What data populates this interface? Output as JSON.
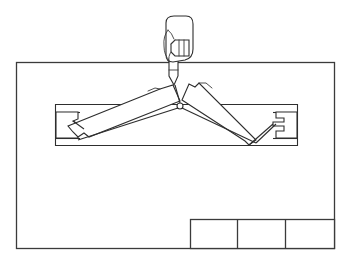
{
  "figure": {
    "title": "",
    "caption": "",
    "background_color": "#ffffff",
    "line_color": "#2e2e2e",
    "frame_color": "#3b3b3b",
    "width": 353,
    "height": 264
  },
  "drawing_frame": {
    "label": "",
    "x": 16,
    "y": 62,
    "width": 319,
    "height": 187
  },
  "title_block": {
    "label": "",
    "x": 190,
    "y": 219,
    "width": 145,
    "height": 30,
    "cells": [
      {
        "label": "",
        "value": ""
      },
      {
        "label": "",
        "value": ""
      },
      {
        "label": "",
        "value": ""
      }
    ],
    "divider_x": [
      237,
      285
    ]
  },
  "track": {
    "label": "",
    "x": 55,
    "y": 104,
    "width": 243,
    "height": 42
  },
  "sliders": [
    {
      "name": "left-slider",
      "label": "",
      "x": 58,
      "y": 108,
      "width": 20,
      "height": 31
    },
    {
      "name": "right-slider",
      "label": "",
      "x": 275,
      "y": 108,
      "width": 20,
      "height": 31
    }
  ],
  "linkage": {
    "label": "",
    "pivot": {
      "x": 179,
      "y": 105
    },
    "arms": [
      {
        "name": "left-arm",
        "label": "",
        "angle_deg": -18
      },
      {
        "name": "right-arm",
        "label": "",
        "angle_deg": 18
      }
    ]
  },
  "stylus": {
    "label": "",
    "tip": {
      "x": 175,
      "y": 82
    },
    "top": {
      "x": 172,
      "y": 50
    }
  },
  "hand": {
    "label": "",
    "x": 156,
    "y": 16,
    "width": 38,
    "height": 50,
    "fingers": 3
  },
  "icons": {
    "hand_icon": "hand-holding-stylus",
    "stylus_icon": "stylus-pointer",
    "frame_icon": "drawing-frame",
    "linkage_icon": "scissor-linkage"
  }
}
